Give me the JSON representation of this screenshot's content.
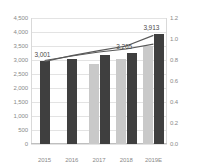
{
  "chart_data": {
    "type": "bar",
    "title": "",
    "subtitle": "",
    "xlabel": "",
    "ylabel": "",
    "y2label": "",
    "categories": [
      "2015",
      "2016",
      "2017",
      "2018",
      "2019E"
    ],
    "ylim": [
      0,
      4500
    ],
    "y2lim": [
      0,
      1.2
    ],
    "yticks": [
      "0",
      "500",
      "1,000",
      "1,500",
      "2,000",
      "2,500",
      "3,000",
      "3,500",
      "4,000",
      "4,500"
    ],
    "ytick_values": [
      0,
      500,
      1000,
      1500,
      2000,
      2500,
      3000,
      3500,
      4000,
      4500
    ],
    "y2ticks": [
      "0.0",
      "0.2",
      "0.4",
      "0.6",
      "0.8",
      "1.0",
      "1.2"
    ],
    "y2tick_values": [
      0.0,
      0.2,
      0.4,
      0.6,
      0.8,
      1.0,
      1.2
    ],
    "grid": true,
    "legend": "none",
    "series": [
      {
        "name": "series-light-bars",
        "kind": "bar",
        "axis": "left",
        "color": "#c9c9c9",
        "values": [
          null,
          null,
          2860,
          3050,
          3490
        ]
      },
      {
        "name": "series-dark-bars",
        "kind": "bar",
        "axis": "left",
        "color": "#3f3f3f",
        "values": [
          2980,
          3030,
          3180,
          3260,
          3913
        ]
      },
      {
        "name": "line-series-1",
        "kind": "line",
        "axis": "right",
        "color": "#595959",
        "values": [
          0.795,
          0.838,
          0.876,
          0.905,
          0.952
        ]
      },
      {
        "name": "line-series-2",
        "kind": "line",
        "axis": "right",
        "color": "#595959",
        "values": [
          0.786,
          0.842,
          0.889,
          0.933,
          1.035
        ]
      }
    ],
    "data_labels": [
      {
        "text": "3,001",
        "category": "2015"
      },
      {
        "text": "3,265",
        "category": "2018"
      },
      {
        "text": "3,913",
        "category": "2019E"
      }
    ],
    "colors": {
      "bar_light": "#c9c9c9",
      "bar_dark": "#3f3f3f",
      "line": "#595959",
      "grid": "#e3e3e3",
      "axis_text": "#8a8a8a",
      "label_text": "#4a4a4a"
    }
  }
}
